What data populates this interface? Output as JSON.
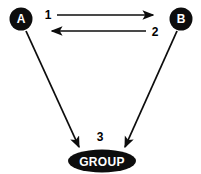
{
  "diagram": {
    "background_color": "#ffffff",
    "shape_color": "#0d0d0d",
    "label_color": "#000000",
    "node_text_color": "#ffffff",
    "nodes": [
      {
        "id": "node-a",
        "label": "A",
        "shape": "circle",
        "cx": 21,
        "cy": 19,
        "r": 11.5,
        "fill": "#0d0d0d",
        "text_color": "#ffffff"
      },
      {
        "id": "node-b",
        "label": "B",
        "shape": "circle",
        "cx": 181,
        "cy": 19,
        "r": 11.5,
        "fill": "#0d0d0d",
        "text_color": "#ffffff"
      },
      {
        "id": "node-group",
        "label": "GROUP",
        "shape": "ellipse",
        "cx": 102,
        "cy": 161,
        "rx": 34,
        "ry": 11.5,
        "fill": "#0d0d0d",
        "text_color": "#ffffff"
      }
    ],
    "edges": [
      {
        "id": "edge-1",
        "label": "1",
        "from": "node-a",
        "to": "node-b",
        "direction": "right",
        "x1": 57,
        "y1": 15,
        "x2": 156,
        "y2": 15,
        "label_x": 48,
        "label_y": 17
      },
      {
        "id": "edge-2",
        "label": "2",
        "from": "node-b",
        "to": "node-a",
        "direction": "left",
        "x1": 146,
        "y1": 31,
        "x2": 50,
        "y2": 31,
        "label_x": 153,
        "label_y": 35
      },
      {
        "id": "edge-3-left",
        "label": "",
        "from": "node-a",
        "to": "node-group",
        "direction": "down-right",
        "x1": 26,
        "y1": 31,
        "x2": 80,
        "y2": 149
      },
      {
        "id": "edge-3-right",
        "label": "3",
        "from": "node-b",
        "to": "node-group",
        "direction": "down-left",
        "x1": 177,
        "y1": 31,
        "x2": 124,
        "y2": 149,
        "label_x": 99,
        "label_y": 140
      }
    ],
    "edge_labels": {
      "one": "1",
      "two": "2",
      "three": "3"
    }
  }
}
